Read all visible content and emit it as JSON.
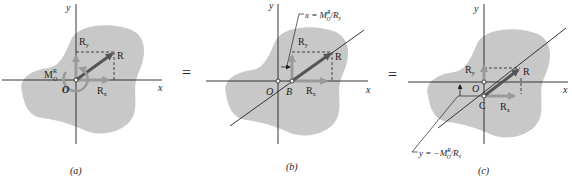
{
  "figure": {
    "panels": [
      {
        "id": "a",
        "caption": "(a)",
        "axis_x": "x",
        "axis_y": "y",
        "origin": "O",
        "resultant": "R",
        "rx": "R",
        "rx_sub": "x",
        "ry": "R",
        "ry_sub": "y",
        "moment": "M",
        "moment_sup": "R",
        "moment_sub": "O"
      },
      {
        "id": "b",
        "caption": "(b)",
        "axis_x": "x",
        "axis_y": "y",
        "origin": "O",
        "point": "B",
        "resultant": "R",
        "rx": "R",
        "rx_sub": "x",
        "ry": "R",
        "ry_sub": "y",
        "dimension_label": "x = M",
        "dimension_sup": "R",
        "dimension_sub": "O",
        "dimension_tail": "/R",
        "dimension_tail_sub": "y"
      },
      {
        "id": "c",
        "caption": "(c)",
        "axis_x": "x",
        "axis_y": "y",
        "origin": "O",
        "point": "C",
        "resultant": "R",
        "rx": "R",
        "rx_sub": "x",
        "ry": "R",
        "ry_sub": "y",
        "dimension_label": "y = −M",
        "dimension_sup": "R",
        "dimension_sub": "O",
        "dimension_tail": "/R",
        "dimension_tail_sub": "x"
      }
    ],
    "equals": [
      "=",
      "="
    ],
    "colors": {
      "blob": "#c8c8c8",
      "arrow_dark": "#555555",
      "arrow_light": "#9a9a9a",
      "axis": "#222222"
    }
  }
}
